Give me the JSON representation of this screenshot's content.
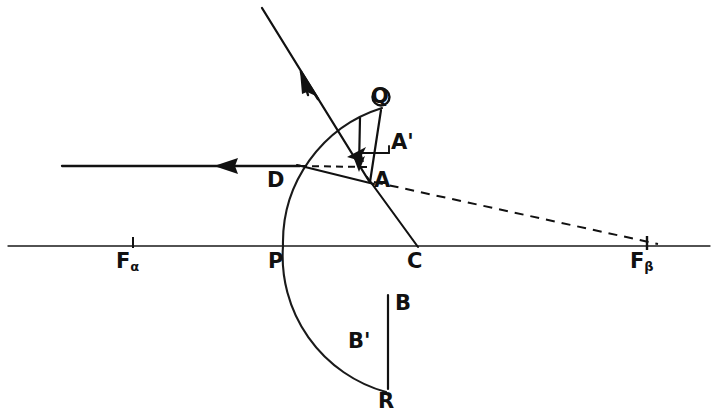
{
  "figure": {
    "background_color": "#ffffff",
    "ink_color": "#111111",
    "width": 715,
    "height": 418
  },
  "labels": {
    "focus_alpha": "F",
    "focus_alpha_sub": "α",
    "focus_beta": "F",
    "focus_beta_sub": "β",
    "pole": "P",
    "center": "C",
    "point_d": "D",
    "point_a": "A",
    "point_a_prime": "A'",
    "point_q": "Q",
    "point_b": "B",
    "point_b_prime": "B'",
    "point_r": "R"
  },
  "geometry": {
    "axis": {
      "y": 246,
      "x_start": 8,
      "x_end": 710
    },
    "mirror_arc": {
      "description": "concave mirror surface, center at C",
      "center_x": 417,
      "center_y": 246,
      "radius": 134,
      "top_point": {
        "x": 382,
        "y": 108
      },
      "bottom_point": {
        "x": 385,
        "y": 392
      }
    },
    "points": {
      "F_alpha": {
        "x": 133,
        "y": 246
      },
      "P": {
        "x": 283,
        "y": 246
      },
      "C": {
        "x": 417,
        "y": 246
      },
      "F_beta": {
        "x": 647,
        "y": 246
      },
      "D": {
        "x": 299,
        "y": 166
      },
      "A": {
        "x": 367,
        "y": 178
      },
      "Q": {
        "x": 382,
        "y": 110
      },
      "B": {
        "x": 388,
        "y": 296
      },
      "R": {
        "x": 388,
        "y": 388
      }
    },
    "rays": [
      {
        "name": "incident-ray-horizontal",
        "from": {
          "x": 62,
          "y": 166
        },
        "to": {
          "x": 299,
          "y": 166
        },
        "arrow_at": {
          "x": 222,
          "y": 166
        },
        "arrow_dir": "left",
        "style": "solid"
      },
      {
        "name": "reflected-ray-upper-left",
        "from": {
          "x": 367,
          "y": 178
        },
        "to": {
          "x": 262,
          "y": 8
        },
        "arrow_at": {
          "x": 310,
          "y": 86
        },
        "arrow_dir": "up-left",
        "style": "solid"
      },
      {
        "name": "normal-line-A-to-C",
        "from": {
          "x": 367,
          "y": 178
        },
        "to": {
          "x": 417,
          "y": 246
        },
        "style": "solid"
      },
      {
        "name": "construction-dashed-D-to-A",
        "from": {
          "x": 299,
          "y": 166
        },
        "to": {
          "x": 366,
          "y": 167
        },
        "style": "dashed"
      },
      {
        "name": "construction-dashed-A-to-Fbeta",
        "from": {
          "x": 372,
          "y": 181
        },
        "to": {
          "x": 655,
          "y": 244
        },
        "style": "dashed"
      },
      {
        "name": "chord-D-to-A",
        "from": {
          "x": 299,
          "y": 166
        },
        "to": {
          "x": 373,
          "y": 183
        },
        "style": "solid"
      }
    ],
    "segments": [
      {
        "name": "segment-Q-to-A",
        "from": {
          "x": 382,
          "y": 110
        },
        "to": {
          "x": 370,
          "y": 180
        }
      },
      {
        "name": "segment-aprime-arrow",
        "from": {
          "x": 360,
          "y": 120
        },
        "to": {
          "x": 359,
          "y": 170
        },
        "arrow": "down"
      },
      {
        "name": "segment-B-to-R",
        "from": {
          "x": 388,
          "y": 296
        },
        "to": {
          "x": 388,
          "y": 388
        }
      }
    ],
    "ticks": [
      {
        "name": "tick-F-alpha",
        "x": 133,
        "y": 246
      },
      {
        "name": "tick-F-beta",
        "x": 647,
        "y": 246
      }
    ]
  }
}
